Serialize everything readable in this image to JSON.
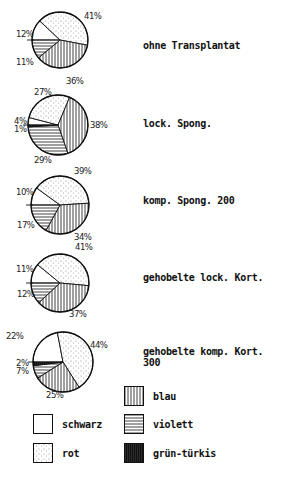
{
  "chart_data": {
    "type": "pie",
    "title": "",
    "legend": [
      {
        "key": "schwarz",
        "label": "schwarz",
        "pattern": "white"
      },
      {
        "key": "rot",
        "label": "rot",
        "pattern": "stippled"
      },
      {
        "key": "blau",
        "label": "blau",
        "pattern": "vertical-lines"
      },
      {
        "key": "violett",
        "label": "violett",
        "pattern": "horizontal-lines"
      },
      {
        "key": "gruen_tuerkis",
        "label": "grün-türkis",
        "pattern": "dense-black-vertical"
      }
    ],
    "charts": [
      {
        "label": "ohne Transplantat",
        "slices": [
          {
            "category": "schwarz",
            "value": 12,
            "label": "12%"
          },
          {
            "category": "rot",
            "value": 41,
            "label": "41%"
          },
          {
            "category": "blau",
            "value": 36,
            "label": "36%"
          },
          {
            "category": "violett",
            "value": 11,
            "label": "11%"
          }
        ]
      },
      {
        "label": "lock. Spong.",
        "slices": [
          {
            "category": "schwarz",
            "value": 4,
            "label": "4%"
          },
          {
            "category": "rot",
            "value": 27,
            "label": "27%"
          },
          {
            "category": "blau",
            "value": 38,
            "label": "38%"
          },
          {
            "category": "violett",
            "value": 29,
            "label": "29%"
          },
          {
            "category": "gruen_tuerkis",
            "value": 1,
            "label": "1%"
          }
        ]
      },
      {
        "label": "komp. Spong. 200",
        "slices": [
          {
            "category": "schwarz",
            "value": 10,
            "label": "10%"
          },
          {
            "category": "rot",
            "value": 39,
            "label": "39%"
          },
          {
            "category": "blau",
            "value": 34,
            "label": "34%"
          },
          {
            "category": "violett",
            "value": 17,
            "label": "17%"
          }
        ]
      },
      {
        "label": "gehobelte lock. Kort.",
        "slices": [
          {
            "category": "schwarz",
            "value": 11,
            "label": "11%"
          },
          {
            "category": "rot",
            "value": 41,
            "label": "41%"
          },
          {
            "category": "blau",
            "value": 37,
            "label": "37%"
          },
          {
            "category": "violett",
            "value": 12,
            "label": "12%"
          }
        ]
      },
      {
        "label": "gehobelte komp. Kort. 300",
        "slices": [
          {
            "category": "schwarz",
            "value": 22,
            "label": "22%"
          },
          {
            "category": "rot",
            "value": 44,
            "label": "44%"
          },
          {
            "category": "blau",
            "value": 25,
            "label": "25%"
          },
          {
            "category": "violett",
            "value": 7,
            "label": "7%"
          },
          {
            "category": "gruen_tuerkis",
            "value": 2,
            "label": "2%"
          }
        ]
      }
    ]
  },
  "rows": [
    {
      "label": "ohne Transplantat",
      "pcts": [
        "41%",
        "12%",
        "11%",
        "36%"
      ]
    },
    {
      "label": "lock. Spong.",
      "pcts": [
        "27%",
        "38%",
        "4%",
        "1%",
        "29%"
      ]
    },
    {
      "label": "komp. Spong. 200",
      "pcts": [
        "39%",
        "10%",
        "17%",
        "34%"
      ]
    },
    {
      "label": "gehobelte lock. Kort.",
      "pcts": [
        "41%",
        "11%",
        "12%",
        "37%"
      ]
    },
    {
      "label": "gehobelte komp. Kort. 300",
      "pcts": [
        "22%",
        "44%",
        "2%",
        "7%",
        "25%"
      ]
    }
  ],
  "legend": {
    "blau": "blau",
    "schwarz": "schwarz",
    "violett": "violett",
    "rot": "rot",
    "gruen_tuerkis": "grün-türkis"
  }
}
